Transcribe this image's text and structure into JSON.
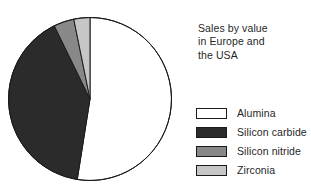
{
  "chart_data": {
    "type": "pie",
    "title": "Sales by value\nin Europe and\nthe USA",
    "title_lines": [
      "Sales by value",
      "in Europe and",
      "the USA"
    ],
    "categories": [
      "Alumina",
      "Silicon carbide",
      "Silicon nitride",
      "Zirconia"
    ],
    "values": [
      52.5,
      40.3,
      4.0,
      3.2
    ],
    "units": "percent of sales by value",
    "start_angle_deg": 0,
    "direction": "clockwise",
    "slices": [
      {
        "label": "Alumina",
        "value": 52.5,
        "start_deg": 0,
        "end_deg": 189,
        "color": "#ffffff",
        "stroke": "#1a1a1a"
      },
      {
        "label": "Silicon carbide",
        "value": 40.3,
        "start_deg": 189,
        "end_deg": 334,
        "color": "#2b2b2b",
        "stroke": "#1a1a1a"
      },
      {
        "label": "Silicon nitride",
        "value": 4.0,
        "start_deg": 334,
        "end_deg": 348.5,
        "color": "#888888",
        "stroke": "#1a1a1a"
      },
      {
        "label": "Zirconia",
        "value": 3.2,
        "start_deg": 348.5,
        "end_deg": 360,
        "color": "#c6c6c6",
        "stroke": "#1a1a1a"
      }
    ],
    "legend": {
      "position": "right",
      "entries": [
        {
          "label": "Alumina",
          "color": "#ffffff"
        },
        {
          "label": "Silicon carbide",
          "color": "#2b2b2b"
        },
        {
          "label": "Silicon nitride",
          "color": "#888888"
        },
        {
          "label": "Zirconia",
          "color": "#c6c6c6"
        }
      ]
    },
    "xlabel": "",
    "ylabel": "",
    "grid": false
  },
  "colors": {
    "outline": "#1a1a1a",
    "background": "#ffffff",
    "text": "#1f1f1f",
    "alumina": "#ffffff",
    "silicon_carbide": "#2b2b2b",
    "silicon_nitride": "#888888",
    "zirconia": "#c6c6c6"
  }
}
